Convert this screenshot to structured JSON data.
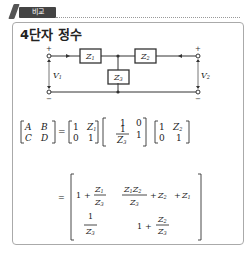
{
  "header": {
    "tag_label": "비교",
    "icon": "pencil-icon"
  },
  "title": "4단자 정수",
  "circuit": {
    "impedances": [
      "Z1",
      "Z2",
      "Z3"
    ],
    "z_labels": {
      "z1": "Z",
      "z1_sub": "1",
      "z2": "Z",
      "z2_sub": "2",
      "z3": "Z",
      "z3_sub": "3"
    },
    "voltages": {
      "v1": "V",
      "v1_sub": "1",
      "v2": "V",
      "v2_sub": "2"
    },
    "plus": "+",
    "minus": "−"
  },
  "equation1": {
    "lhs": [
      [
        "A",
        "B"
      ],
      [
        "C",
        "D"
      ]
    ],
    "eq": "=",
    "m1": [
      [
        "1",
        "Z1"
      ],
      [
        "0",
        "1"
      ]
    ],
    "m2": [
      [
        "1",
        "0"
      ],
      [
        "1/Z3",
        "1"
      ]
    ],
    "m3": [
      [
        "1",
        "Z2"
      ],
      [
        "0",
        "1"
      ]
    ]
  },
  "equation2": {
    "eq": "=",
    "result": [
      [
        "1 + Z1/Z3",
        "Z1Z2/Z3 + Z2 + Z1"
      ],
      [
        "1/Z3",
        "1 + Z2/Z3"
      ]
    ]
  },
  "text": {
    "one": "1",
    "zero": "0",
    "plus_sign": "+",
    "A": "A",
    "B": "B",
    "C": "C",
    "D": "D",
    "Z": "Z",
    "s1": "1",
    "s2": "2",
    "s3": "3"
  }
}
